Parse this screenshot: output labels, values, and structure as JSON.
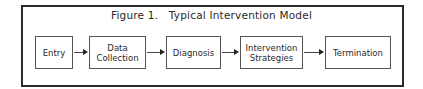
{
  "figure": {
    "title": "Figure 1.   Typical Intervention Model",
    "nodes": [
      {
        "label": "Entry"
      },
      {
        "label": "Data\nCollection"
      },
      {
        "label": "Diagnosis"
      },
      {
        "label": "Intervention\nStrategies"
      },
      {
        "label": "Termination"
      }
    ],
    "edges": [
      {
        "from": "Entry",
        "to": "Data Collection"
      },
      {
        "from": "Data Collection",
        "to": "Diagnosis"
      },
      {
        "from": "Diagnosis",
        "to": "Intervention Strategies"
      },
      {
        "from": "Intervention Strategies",
        "to": "Termination"
      }
    ],
    "colors": {
      "border": "#2b2b2b",
      "text": "#2a2a2a",
      "background": "#ffffff"
    }
  }
}
